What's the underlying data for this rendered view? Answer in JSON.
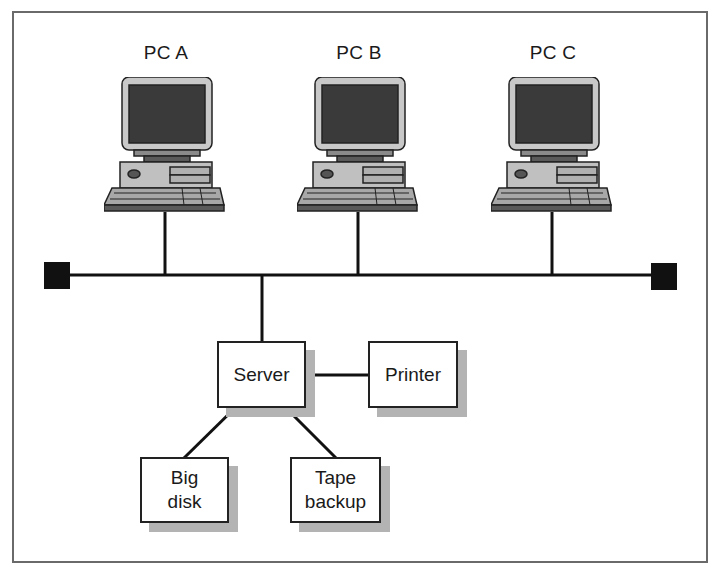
{
  "diagram": {
    "type": "bus network topology",
    "nodes": {
      "pcs": [
        {
          "id": "pc-a",
          "label": "PC A"
        },
        {
          "id": "pc-b",
          "label": "PC B"
        },
        {
          "id": "pc-c",
          "label": "PC C"
        }
      ],
      "server": {
        "label": "Server"
      },
      "printer": {
        "label": "Printer"
      },
      "big_disk": {
        "label": "Big\ndisk"
      },
      "tape_backup": {
        "label": "Tape\nbackup"
      }
    },
    "edges": [
      [
        "PC A",
        "bus"
      ],
      [
        "PC B",
        "bus"
      ],
      [
        "PC C",
        "bus"
      ],
      [
        "Server",
        "bus"
      ],
      [
        "Server",
        "Printer"
      ],
      [
        "Server",
        "Big disk"
      ],
      [
        "Server",
        "Tape backup"
      ]
    ],
    "terminators": [
      "left-terminator",
      "right-terminator"
    ],
    "colors": {
      "line": "#111111",
      "shadow": "#b3b3b3",
      "monitor_bezel": "#c8c8c8",
      "screen": "#3a3a3a"
    }
  }
}
